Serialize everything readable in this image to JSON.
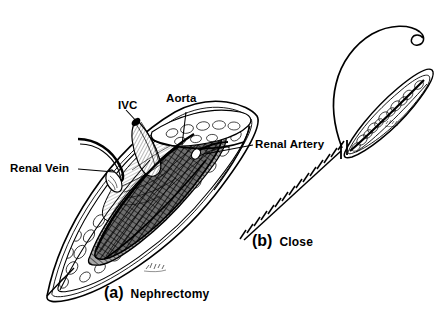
{
  "figure": {
    "title_alt": "Nephrectomy and closure surgical illustration",
    "background_color": "#ffffff",
    "ink_color": "#000000",
    "labels": {
      "ivc": "IVC",
      "aorta": "Aorta",
      "renal_vein": "Renal Vein",
      "renal_artery": "Renal Artery"
    },
    "captions": {
      "panel_a_letter": "(a)",
      "panel_a_word": "Nephrectomy",
      "panel_b_letter": "(b)",
      "panel_b_word": "Close"
    }
  }
}
